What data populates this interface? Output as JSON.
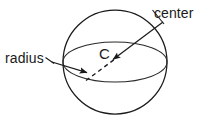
{
  "figure": {
    "kind": "sphere-geometry-diagram",
    "background_color": "#ffffff",
    "stroke_color": "#1a1a1a",
    "width": 206,
    "height": 120
  },
  "labels": {
    "center": "center",
    "radius": "radius",
    "center_point": "C"
  },
  "shapes": {
    "sphere_outline": {
      "name": "sphere-circle",
      "cx": 115,
      "cy": 62,
      "r": 52
    },
    "equator": {
      "name": "equator-ellipse",
      "cx": 115,
      "cy": 62,
      "rx": 52,
      "ry": 20
    },
    "radius_arrow": {
      "name": "radius-arrow",
      "x1": 52,
      "y1": 62,
      "x2": 89,
      "y2": 73,
      "style": "solid"
    },
    "radius_leader": {
      "name": "radius-leader-line",
      "x1": 46,
      "y1": 58,
      "x2": 54,
      "y2": 64
    },
    "center_arrow": {
      "name": "center-arrow",
      "x1": 163,
      "y1": 22,
      "x2": 112,
      "y2": 60,
      "style": "solid"
    },
    "center_leader": {
      "name": "center-leader-line",
      "x1": 153,
      "y1": 10,
      "x2": 164,
      "y2": 24
    },
    "depth_dash": {
      "name": "depth-dashed-line",
      "x1": 87,
      "y1": 80,
      "x2": 118,
      "y2": 58,
      "style": "dashed"
    }
  }
}
